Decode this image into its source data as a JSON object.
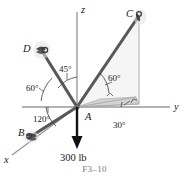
{
  "figure": {
    "caption": "F3–10",
    "colors": {
      "cable": "#58585a",
      "axis": "#9a9a9a",
      "shade": "#c9c9c9",
      "text": "#1a1a1a",
      "caption": "#6f7a8a",
      "load_arrow": "#111111"
    },
    "axes": [
      {
        "name": "z-axis",
        "label": "z"
      },
      {
        "name": "y-axis",
        "label": "y"
      },
      {
        "name": "x-axis",
        "label": "x"
      }
    ],
    "points": [
      {
        "name": "point-A",
        "label": "A"
      },
      {
        "name": "point-B",
        "label": "B"
      },
      {
        "name": "point-C",
        "label": "C"
      },
      {
        "name": "point-D",
        "label": "D"
      }
    ],
    "angles": [
      {
        "name": "angle-45",
        "label": "45°"
      },
      {
        "name": "angle-60-left",
        "label": "60°"
      },
      {
        "name": "angle-120",
        "label": "120°"
      },
      {
        "name": "angle-60-right",
        "label": "60°"
      },
      {
        "name": "angle-30",
        "label": "30°"
      }
    ],
    "load": {
      "label": "300 lb",
      "direction": "downward"
    }
  }
}
